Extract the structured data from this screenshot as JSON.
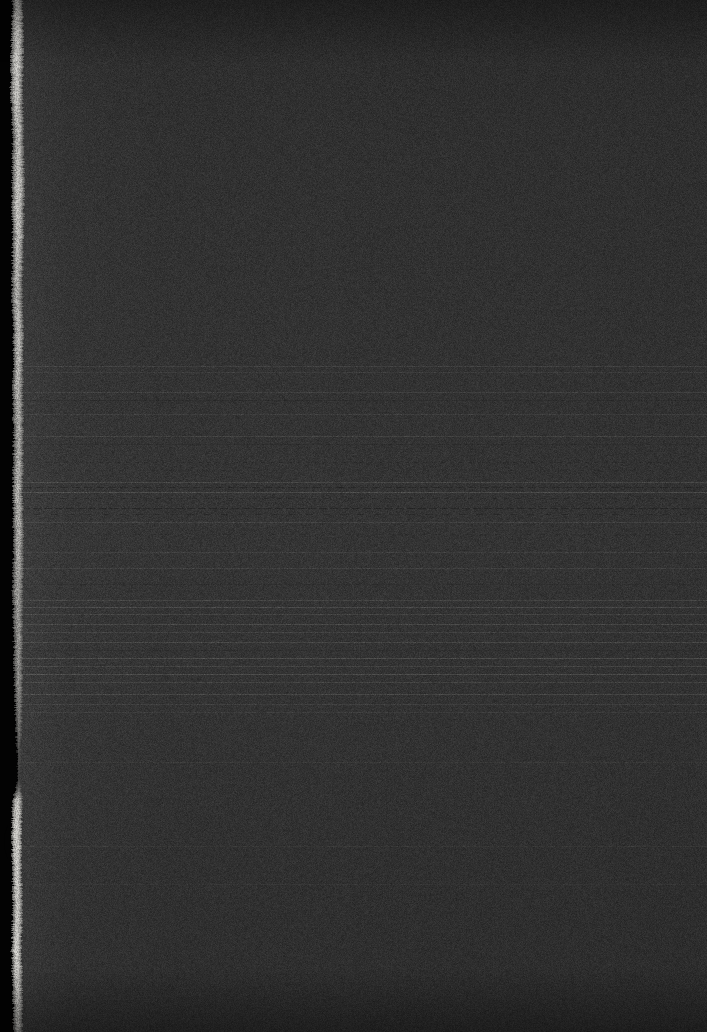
{
  "image": {
    "kind": "underexposed-document-scan",
    "width": 707,
    "height": 1032,
    "description": "Severely underexposed photograph of a document page. Nearly the whole frame is a flat dark grainy surface. A band of faint horizontal striations runs across the middle third, consistent with lines of text lost to underexposure. A black border runs down the left edge, and a bright irregular vertical strip (the lit page edge or binding gutter) sits just inside it.",
    "legible_text": "none",
    "readable_content": "none"
  },
  "palette": {
    "outer_border_black": "#030303",
    "page_base": "#2f2f2f",
    "page_darkest": "#2a2a2a",
    "page_lightest": "#363636",
    "edge_strip_bright": "#d8d6d0",
    "edge_strip_mid": "#a8a6a0",
    "edge_strip_dim": "#6e6c68",
    "striation_light": "rgba(190,190,185,0.18)",
    "striation_dark": "rgba(0,0,0,0.30)"
  },
  "regions": {
    "left_black_border": {
      "label": "left-black-border",
      "x": 0,
      "width": 18,
      "top": 0,
      "height": 1032,
      "color": "#030303"
    },
    "bright_edge_strip": {
      "label": "bright-page-edge-strip",
      "approx_x": 10,
      "approx_width": 12,
      "note": "Irregular torn-edge contour; narrows to a near break around y=750-790, then resumes wider and brighter below."
    },
    "border_notch": {
      "label": "border-notch",
      "center_y": 842,
      "height": 34,
      "note": "Concave indentation biting into the black border from the left."
    },
    "upper_plain_field": {
      "label": "upper-plain-field",
      "y_start": 0,
      "y_end": 362,
      "note": "Flat grain, no structure."
    },
    "striation_band": {
      "label": "horizontal-striation-band",
      "y_start": 362,
      "y_end": 712,
      "note": "Faint horizontal lines spanning the full page width; densest and most dashed between y=480 and y=540."
    },
    "lower_plain_field": {
      "label": "lower-plain-field",
      "y_start": 712,
      "y_end": 1032,
      "note": "Returns to flat grain with only two or three very faint lines."
    }
  },
  "edge_contour": [
    {
      "y": 0,
      "left": 12,
      "right": 22,
      "brightness": 0.72
    },
    {
      "y": 40,
      "left": 11,
      "right": 23,
      "brightness": 0.85
    },
    {
      "y": 90,
      "left": 10,
      "right": 22,
      "brightness": 0.8
    },
    {
      "y": 140,
      "left": 12,
      "right": 23,
      "brightness": 0.74
    },
    {
      "y": 190,
      "left": 11,
      "right": 24,
      "brightness": 0.82
    },
    {
      "y": 240,
      "left": 12,
      "right": 23,
      "brightness": 0.78
    },
    {
      "y": 290,
      "left": 11,
      "right": 22,
      "brightness": 0.7
    },
    {
      "y": 340,
      "left": 13,
      "right": 23,
      "brightness": 0.76
    },
    {
      "y": 390,
      "left": 12,
      "right": 22,
      "brightness": 0.72
    },
    {
      "y": 440,
      "left": 13,
      "right": 23,
      "brightness": 0.68
    },
    {
      "y": 490,
      "left": 12,
      "right": 22,
      "brightness": 0.74
    },
    {
      "y": 540,
      "left": 13,
      "right": 23,
      "brightness": 0.7
    },
    {
      "y": 590,
      "left": 12,
      "right": 22,
      "brightness": 0.66
    },
    {
      "y": 640,
      "left": 13,
      "right": 22,
      "brightness": 0.62
    },
    {
      "y": 690,
      "left": 14,
      "right": 22,
      "brightness": 0.58
    },
    {
      "y": 730,
      "left": 15,
      "right": 21,
      "brightness": 0.46
    },
    {
      "y": 760,
      "left": 17,
      "right": 20,
      "brightness": 0.22
    },
    {
      "y": 780,
      "left": 17,
      "right": 20,
      "brightness": 0.16
    },
    {
      "y": 800,
      "left": 12,
      "right": 22,
      "brightness": 0.8
    },
    {
      "y": 830,
      "left": 11,
      "right": 21,
      "brightness": 0.88
    },
    {
      "y": 870,
      "left": 12,
      "right": 21,
      "brightness": 0.84
    },
    {
      "y": 910,
      "left": 12,
      "right": 22,
      "brightness": 0.8
    },
    {
      "y": 950,
      "left": 11,
      "right": 21,
      "brightness": 0.86
    },
    {
      "y": 990,
      "left": 12,
      "right": 22,
      "brightness": 0.78
    },
    {
      "y": 1032,
      "left": 13,
      "right": 22,
      "brightness": 0.64
    }
  ],
  "striations": [
    {
      "y": 366,
      "tone": "light",
      "opacity": 0.1,
      "dash": false
    },
    {
      "y": 372,
      "tone": "light",
      "opacity": 0.07,
      "dash": false
    },
    {
      "y": 392,
      "tone": "light",
      "opacity": 0.09,
      "dash": false
    },
    {
      "y": 400,
      "tone": "dark",
      "opacity": 0.1,
      "dash": false
    },
    {
      "y": 414,
      "tone": "light",
      "opacity": 0.08,
      "dash": false
    },
    {
      "y": 436,
      "tone": "light",
      "opacity": 0.11,
      "dash": false
    },
    {
      "y": 444,
      "tone": "dark",
      "opacity": 0.09,
      "dash": false
    },
    {
      "y": 462,
      "tone": "dark",
      "opacity": 0.16,
      "dash": true
    },
    {
      "y": 470,
      "tone": "dark",
      "opacity": 0.12,
      "dash": true
    },
    {
      "y": 482,
      "tone": "light",
      "opacity": 0.13,
      "dash": false
    },
    {
      "y": 487,
      "tone": "dark",
      "opacity": 0.22,
      "dash": true
    },
    {
      "y": 492,
      "tone": "light",
      "opacity": 0.16,
      "dash": false
    },
    {
      "y": 498,
      "tone": "dark",
      "opacity": 0.18,
      "dash": true
    },
    {
      "y": 508,
      "tone": "dark",
      "opacity": 0.26,
      "dash": true
    },
    {
      "y": 514,
      "tone": "dark",
      "opacity": 0.2,
      "dash": true
    },
    {
      "y": 522,
      "tone": "light",
      "opacity": 0.1,
      "dash": false
    },
    {
      "y": 534,
      "tone": "dark",
      "opacity": 0.12,
      "dash": true
    },
    {
      "y": 552,
      "tone": "light",
      "opacity": 0.08,
      "dash": false
    },
    {
      "y": 568,
      "tone": "light",
      "opacity": 0.09,
      "dash": false
    },
    {
      "y": 584,
      "tone": "dark",
      "opacity": 0.08,
      "dash": false
    },
    {
      "y": 600,
      "tone": "light",
      "opacity": 0.12,
      "dash": false
    },
    {
      "y": 607,
      "tone": "light",
      "opacity": 0.15,
      "dash": false
    },
    {
      "y": 614,
      "tone": "light",
      "opacity": 0.11,
      "dash": false
    },
    {
      "y": 624,
      "tone": "light",
      "opacity": 0.14,
      "dash": false
    },
    {
      "y": 632,
      "tone": "light",
      "opacity": 0.1,
      "dash": false
    },
    {
      "y": 642,
      "tone": "light",
      "opacity": 0.13,
      "dash": false
    },
    {
      "y": 650,
      "tone": "dark",
      "opacity": 0.1,
      "dash": true
    },
    {
      "y": 658,
      "tone": "light",
      "opacity": 0.16,
      "dash": false
    },
    {
      "y": 666,
      "tone": "light",
      "opacity": 0.12,
      "dash": false
    },
    {
      "y": 674,
      "tone": "light",
      "opacity": 0.17,
      "dash": false
    },
    {
      "y": 682,
      "tone": "light",
      "opacity": 0.11,
      "dash": false
    },
    {
      "y": 694,
      "tone": "light",
      "opacity": 0.14,
      "dash": false
    },
    {
      "y": 704,
      "tone": "light",
      "opacity": 0.09,
      "dash": false
    },
    {
      "y": 712,
      "tone": "light",
      "opacity": 0.07,
      "dash": false
    },
    {
      "y": 762,
      "tone": "light",
      "opacity": 0.05,
      "dash": false
    },
    {
      "y": 846,
      "tone": "light",
      "opacity": 0.05,
      "dash": false
    },
    {
      "y": 884,
      "tone": "light",
      "opacity": 0.04,
      "dash": false
    }
  ]
}
